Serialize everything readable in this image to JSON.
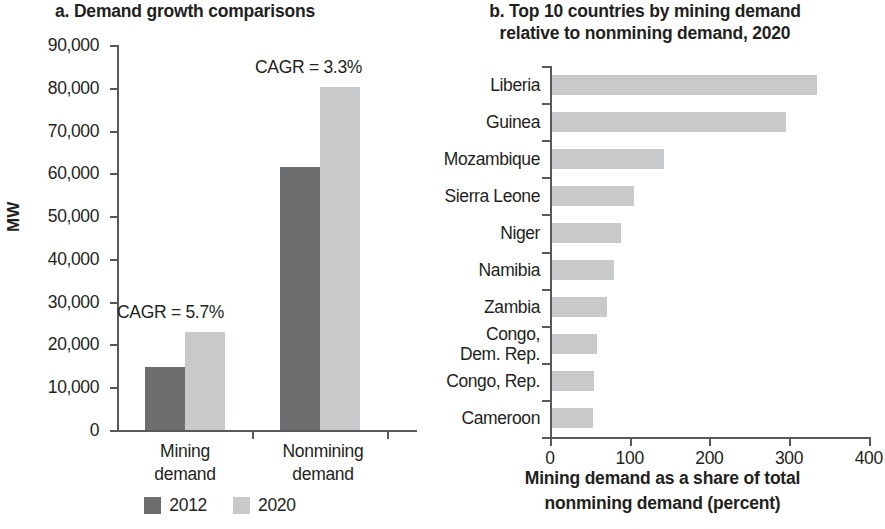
{
  "panel_a": {
    "title": "a. Demand growth comparisons",
    "ylabel": "MW",
    "ytick_labels": [
      "90,000",
      "80,000",
      "70,000",
      "60,000",
      "50,000",
      "40,000",
      "30,000",
      "20,000",
      "10,000",
      "0"
    ],
    "categories": [
      "Mining\ndemand",
      "Nonmining\ndemand"
    ],
    "category_labels": [
      "Mining demand",
      "Nonmining demand"
    ],
    "annotations": [
      {
        "text": "CAGR = 5.7%"
      },
      {
        "text": "CAGR = 3.3%"
      }
    ],
    "legend": [
      {
        "label": "2012",
        "color": "#6d6e70"
      },
      {
        "label": "2020",
        "color": "#c8c9ca"
      }
    ]
  },
  "panel_b": {
    "title": "b. Top 10 countries by mining demand relative to nonmining demand, 2020",
    "title_line1": "b. Top 10 countries by mining demand",
    "title_line2": "relative to nonmining demand, 2020",
    "axis_title_line1": "Mining demand as a share of total",
    "axis_title_line2": "nonmining demand (percent)",
    "xtick_labels": [
      "0",
      "100",
      "200",
      "300",
      "400"
    ],
    "bar_color": "#c8c9ca"
  },
  "chart_data": [
    {
      "type": "bar",
      "title": "a. Demand growth comparisons",
      "xlabel": "",
      "ylabel": "MW",
      "ylim": [
        0,
        90000
      ],
      "ytick_values": [
        0,
        10000,
        20000,
        30000,
        40000,
        50000,
        60000,
        70000,
        80000,
        90000
      ],
      "grid": false,
      "legend_position": "bottom",
      "categories": [
        "Mining demand",
        "Nonmining demand"
      ],
      "series": [
        {
          "name": "2012",
          "color": "#6d6e70",
          "values": [
            14700,
            61500
          ]
        },
        {
          "name": "2020",
          "color": "#c8c9ca",
          "values": [
            23000,
            80200
          ]
        }
      ],
      "annotations": [
        {
          "text": "CAGR = 5.7%",
          "category": "Mining demand"
        },
        {
          "text": "CAGR = 3.3%",
          "category": "Nonmining demand"
        }
      ]
    },
    {
      "type": "bar",
      "orientation": "horizontal",
      "title": "b. Top 10 countries by mining demand relative to nonmining demand, 2020",
      "xlabel": "Mining demand as a share of total nonmining demand (percent)",
      "ylabel": "",
      "xlim": [
        0,
        400
      ],
      "xtick_values": [
        0,
        100,
        200,
        300,
        400
      ],
      "grid": false,
      "legend_position": "none",
      "bar_color": "#c8c9ca",
      "categories": [
        "Liberia",
        "Guinea",
        "Mozambique",
        "Sierra Leone",
        "Niger",
        "Namibia",
        "Zambia",
        "Congo, Dem. Rep.",
        "Congo, Rep.",
        "Cameroon"
      ],
      "values": [
        332,
        294,
        140,
        103,
        87,
        78,
        69,
        56,
        53,
        51
      ]
    }
  ]
}
